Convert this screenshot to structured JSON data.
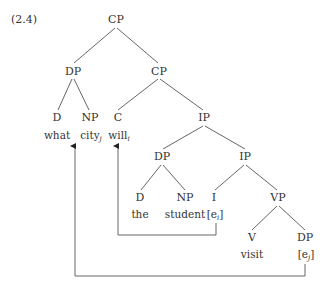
{
  "example_number": "(2.4)",
  "nodes": {
    "cp_root": "CP",
    "dp_spec": "DP",
    "cp_bar": "CP",
    "d_what": "D",
    "np_city": "NP",
    "c": "C",
    "ip_top": "IP",
    "dp_subj": "DP",
    "ip_bar": "IP",
    "d_the": "D",
    "np_student": "NP",
    "i": "I",
    "vp": "VP",
    "v": "V",
    "dp_obj": "DP"
  },
  "words": {
    "what": "what",
    "city": "city",
    "city_index": "j",
    "will": "will",
    "will_index": "i",
    "the": "the",
    "student": "student",
    "trace_i_open": "[e",
    "trace_i_index": "i",
    "trace_i_close": "]",
    "visit": "visit",
    "trace_j_open": "[e",
    "trace_j_index": "j",
    "trace_j_close": "]"
  },
  "colors": {
    "line": "#555555",
    "text": "#333333"
  }
}
